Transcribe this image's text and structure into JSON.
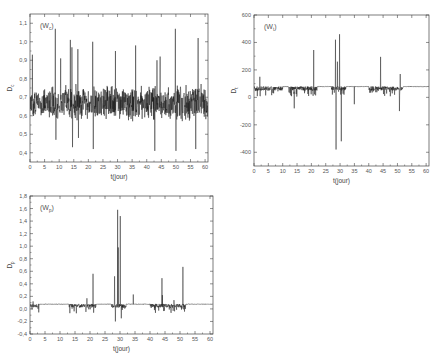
{
  "figure": {
    "caption_visible": false
  },
  "chart_data": [
    {
      "id": "Wc",
      "type": "line",
      "panel_label": "(W c)",
      "panel_label_main": "W",
      "panel_label_sub": "c",
      "xlabel": "t(jour)",
      "ylabel": "D",
      "ylabel_sub": "c",
      "xlim": [
        0,
        61
      ],
      "ylim": [
        0.35,
        1.15
      ],
      "xticks": [
        0,
        5,
        10,
        15,
        20,
        25,
        30,
        35,
        40,
        45,
        50,
        55,
        60
      ],
      "yticks": [
        0.4,
        0.5,
        0.6,
        0.7,
        0.8,
        0.9,
        1.0,
        1.1
      ],
      "ytick_labels": [
        "0,4",
        "0,5",
        "0,6",
        "0,7",
        "0,8",
        "0,9",
        "1,0",
        "1,1"
      ],
      "grid": false,
      "baseline": 0.67,
      "noise_amplitude": 0.07,
      "spikes": [
        {
          "x": 0.8,
          "y": 0.93
        },
        {
          "x": 8.7,
          "y": 1.07
        },
        {
          "x": 8.9,
          "y": 0.47
        },
        {
          "x": 10.5,
          "y": 0.91
        },
        {
          "x": 13.8,
          "y": 1.01
        },
        {
          "x": 14.4,
          "y": 0.97
        },
        {
          "x": 14.6,
          "y": 0.43
        },
        {
          "x": 16.4,
          "y": 0.96
        },
        {
          "x": 16.6,
          "y": 0.48
        },
        {
          "x": 21.5,
          "y": 1.0
        },
        {
          "x": 21.7,
          "y": 0.42
        },
        {
          "x": 29.3,
          "y": 0.95
        },
        {
          "x": 36.2,
          "y": 0.98
        },
        {
          "x": 42.8,
          "y": 0.41
        },
        {
          "x": 43.5,
          "y": 0.9
        },
        {
          "x": 44.6,
          "y": 0.92
        },
        {
          "x": 49.8,
          "y": 1.07
        },
        {
          "x": 50.0,
          "y": 0.41
        },
        {
          "x": 56.8,
          "y": 0.42
        },
        {
          "x": 57.6,
          "y": 1.02
        }
      ],
      "colors": {
        "line": "#111111",
        "axis": "#444444"
      }
    },
    {
      "id": "Wt",
      "type": "line",
      "panel_label_main": "W",
      "panel_label_sub": "t",
      "xlabel": "t(jour)",
      "ylabel": "D",
      "ylabel_sub": "t",
      "xlim": [
        0,
        61
      ],
      "ylim": [
        -500,
        600
      ],
      "xticks": [
        0,
        5,
        10,
        15,
        20,
        25,
        30,
        35,
        40,
        45,
        50,
        55,
        60
      ],
      "yticks": [
        -400,
        -200,
        0,
        200,
        400,
        600
      ],
      "ytick_labels": [
        "-400",
        "-200",
        "0",
        "200",
        "400",
        "600"
      ],
      "grid": false,
      "baseline": 80,
      "noise_amplitude": 25,
      "noise_direction": "down",
      "active_segments": [
        [
          0,
          10
        ],
        [
          12,
          22
        ],
        [
          27,
          32
        ],
        [
          40,
          52
        ]
      ],
      "spikes": [
        {
          "x": 2.0,
          "y": 150
        },
        {
          "x": 14.0,
          "y": -80
        },
        {
          "x": 20.8,
          "y": 345
        },
        {
          "x": 28.4,
          "y": 420
        },
        {
          "x": 28.6,
          "y": -380
        },
        {
          "x": 29.1,
          "y": 260
        },
        {
          "x": 29.8,
          "y": 460
        },
        {
          "x": 30.4,
          "y": -320
        },
        {
          "x": 35.0,
          "y": -50
        },
        {
          "x": 44.1,
          "y": 295
        },
        {
          "x": 51.0,
          "y": 170
        },
        {
          "x": 50.7,
          "y": -100
        }
      ],
      "colors": {
        "line": "#111111",
        "axis": "#444444"
      }
    },
    {
      "id": "Wp",
      "type": "line",
      "panel_label_main": "W",
      "panel_label_sub": "p",
      "xlabel": "t(jour)",
      "ylabel": "D",
      "ylabel_sub": "p",
      "xlim": [
        0,
        61
      ],
      "ylim": [
        -0.4,
        1.8
      ],
      "xticks": [
        0,
        5,
        10,
        15,
        20,
        25,
        30,
        35,
        40,
        45,
        50,
        55,
        60
      ],
      "yticks": [
        -0.4,
        -0.2,
        0.0,
        0.2,
        0.4,
        0.6,
        0.8,
        1.0,
        1.2,
        1.4,
        1.6,
        1.8
      ],
      "ytick_labels": [
        "-0,4",
        "-0,2",
        "0,0",
        "0,2",
        "0,4",
        "0,6",
        "0,8",
        "1,0",
        "1,2",
        "1,4",
        "1,6",
        "1,8"
      ],
      "grid": false,
      "baseline": 0.08,
      "noise_amplitude": 0.05,
      "noise_direction": "down",
      "active_segments": [
        [
          0,
          3
        ],
        [
          13,
          22
        ],
        [
          27,
          32
        ],
        [
          40,
          52
        ]
      ],
      "spikes": [
        {
          "x": 1.0,
          "y": 0.12
        },
        {
          "x": 19.0,
          "y": 0.17
        },
        {
          "x": 21.0,
          "y": 0.56
        },
        {
          "x": 28.2,
          "y": 0.52
        },
        {
          "x": 28.5,
          "y": -0.2
        },
        {
          "x": 29.2,
          "y": 1.58
        },
        {
          "x": 29.4,
          "y": 0.98
        },
        {
          "x": 30.1,
          "y": 1.48
        },
        {
          "x": 30.4,
          "y": -0.15
        },
        {
          "x": 34.4,
          "y": 0.23
        },
        {
          "x": 44.0,
          "y": 0.49
        },
        {
          "x": 44.1,
          "y": 0.22
        },
        {
          "x": 51.0,
          "y": 0.67
        },
        {
          "x": 48.0,
          "y": 0.14
        }
      ],
      "colors": {
        "line": "#111111",
        "axis": "#444444"
      }
    }
  ],
  "layout_panels": [
    {
      "chart_index": 0,
      "left": 30,
      "top": 14,
      "width": 178,
      "height": 148
    },
    {
      "chart_index": 1,
      "left": 254,
      "top": 15,
      "width": 175,
      "height": 151
    },
    {
      "chart_index": 2,
      "left": 30,
      "top": 196,
      "width": 183,
      "height": 138
    }
  ]
}
